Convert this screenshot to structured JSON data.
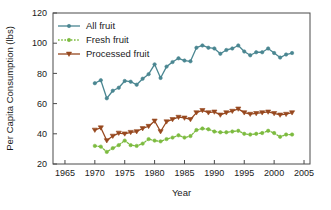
{
  "chart_data": {
    "type": "line",
    "title": "",
    "xlabel": "Year",
    "ylabel": "Per Capita Consumption (lbs)",
    "xlim": [
      1963,
      2006
    ],
    "ylim": [
      20,
      120
    ],
    "xticks": [
      1965,
      1970,
      1975,
      1980,
      1985,
      1990,
      1995,
      2000,
      2005
    ],
    "yticks": [
      20,
      40,
      60,
      80,
      100,
      120
    ],
    "grid": false,
    "legend_position": "top-left",
    "x": [
      1970,
      1971,
      1972,
      1973,
      1974,
      1975,
      1976,
      1977,
      1978,
      1979,
      1980,
      1981,
      1982,
      1983,
      1984,
      1985,
      1986,
      1987,
      1988,
      1989,
      1990,
      1991,
      1992,
      1993,
      1994,
      1995,
      1996,
      1997,
      1998,
      1999,
      2000,
      2001,
      2002,
      2003
    ],
    "series": [
      {
        "name": "All fruit",
        "color": "#4a8691",
        "marker": "circle",
        "linestyle": "solid",
        "values": [
          73.5,
          75.5,
          63.5,
          68.5,
          70.5,
          75.0,
          74.5,
          72.5,
          76.5,
          79.5,
          86.0,
          77.0,
          84.5,
          87.5,
          90.0,
          88.5,
          88.0,
          97.0,
          98.5,
          97.0,
          96.5,
          93.0,
          95.5,
          96.5,
          98.5,
          94.5,
          92.0,
          94.0,
          94.0,
          96.5,
          93.5,
          90.5,
          92.5,
          93.5
        ]
      },
      {
        "name": "Fresh fruit",
        "color": "#7cbb3f",
        "marker": "circle",
        "linestyle": "dotted",
        "values": [
          32.0,
          31.5,
          28.0,
          30.5,
          32.5,
          35.5,
          32.5,
          32.0,
          33.5,
          36.5,
          35.5,
          35.0,
          36.5,
          37.5,
          39.0,
          37.5,
          38.5,
          42.5,
          43.5,
          43.0,
          41.5,
          41.0,
          41.0,
          41.5,
          42.0,
          40.0,
          39.5,
          40.0,
          40.5,
          42.0,
          40.5,
          38.0,
          39.5,
          39.5
        ]
      },
      {
        "name": "Processed fruit",
        "color": "#97481f",
        "marker": "triangle-down",
        "linestyle": "solid",
        "values": [
          42.5,
          44.0,
          35.5,
          38.5,
          40.5,
          40.0,
          41.0,
          41.5,
          43.5,
          45.0,
          48.5,
          41.5,
          48.0,
          49.5,
          51.0,
          50.5,
          49.5,
          54.0,
          55.5,
          54.0,
          54.5,
          52.5,
          54.0,
          55.0,
          56.5,
          54.0,
          53.0,
          53.5,
          54.0,
          54.5,
          53.5,
          52.5,
          53.0,
          54.0
        ]
      }
    ]
  },
  "legend": {
    "items": [
      {
        "label": "All fruit"
      },
      {
        "label": "Fresh fruit"
      },
      {
        "label": "Processed fruit"
      }
    ]
  },
  "axes": {
    "x_title": "Year",
    "y_title": "Per Capita Consumption (lbs)"
  }
}
